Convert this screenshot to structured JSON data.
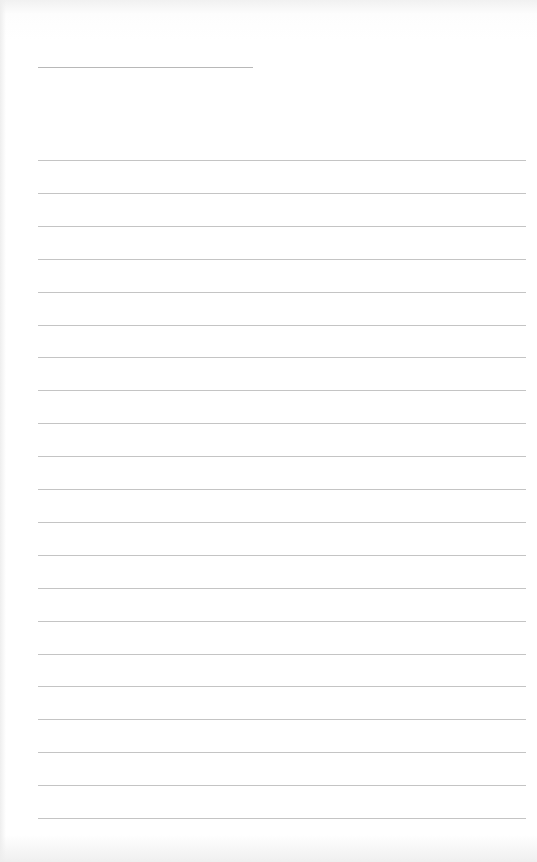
{
  "page": {
    "type": "lined-paper",
    "header_line": {
      "label": ""
    },
    "ruled_lines_count": 21,
    "line_color": "#c4c4c4",
    "paper_color": "#ffffff",
    "lines": [
      "",
      "",
      "",
      "",
      "",
      "",
      "",
      "",
      "",
      "",
      "",
      "",
      "",
      "",
      "",
      "",
      "",
      "",
      "",
      "",
      ""
    ]
  }
}
